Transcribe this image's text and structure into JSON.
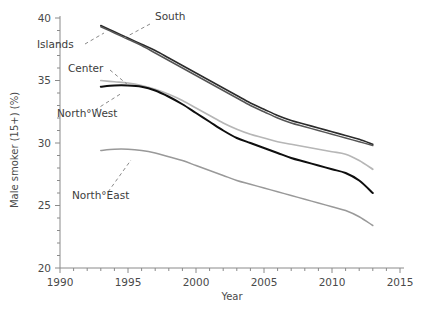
{
  "chart_data": {
    "type": "line",
    "title": "",
    "xlabel": "Year",
    "ylabel": "Male smoker (15+) (%)",
    "xlim": [
      1990,
      2015
    ],
    "ylim": [
      20,
      40
    ],
    "grid": false,
    "legend_position": "inline-annotations",
    "x_ticks": [
      1990,
      1995,
      2000,
      2005,
      2010,
      2015
    ],
    "x_tick_labels": [
      "1990",
      "1995",
      "2000",
      "2005",
      "2010",
      "2015"
    ],
    "x_minor_tick_step": 1,
    "y_ticks": [
      20,
      25,
      30,
      35,
      40
    ],
    "y_tick_labels": [
      "20",
      "25",
      "30",
      "35",
      "40"
    ],
    "y_minor_tick_step": 1,
    "x": [
      1993,
      1994,
      1995,
      1996,
      1997,
      1998,
      1999,
      2000,
      2001,
      2002,
      2003,
      2004,
      2005,
      2006,
      2007,
      2008,
      2009,
      2010,
      2011,
      2012,
      2013
    ],
    "series": [
      {
        "name": "South",
        "color": "#2b2b2b",
        "width": 1.6,
        "values": [
          39.4,
          38.9,
          38.4,
          37.9,
          37.4,
          36.8,
          36.2,
          35.6,
          35.0,
          34.4,
          33.8,
          33.2,
          32.7,
          32.2,
          31.8,
          31.5,
          31.2,
          30.9,
          30.6,
          30.3,
          29.9
        ]
      },
      {
        "name": "Islands",
        "color": "#555555",
        "width": 1.5,
        "values": [
          39.3,
          38.8,
          38.3,
          37.8,
          37.2,
          36.6,
          36.0,
          35.4,
          34.8,
          34.2,
          33.6,
          33.0,
          32.5,
          32.0,
          31.6,
          31.3,
          31.0,
          30.7,
          30.4,
          30.1,
          29.8
        ]
      },
      {
        "name": "Center",
        "color": "#b6b6b6",
        "width": 1.7,
        "values": [
          35.0,
          34.9,
          34.8,
          34.6,
          34.3,
          33.9,
          33.4,
          32.8,
          32.2,
          31.6,
          31.1,
          30.7,
          30.4,
          30.1,
          29.9,
          29.7,
          29.5,
          29.3,
          29.1,
          28.6,
          27.9
        ]
      },
      {
        "name": "North West",
        "color": "#0e0e0e",
        "width": 2.0,
        "values": [
          34.5,
          34.6,
          34.6,
          34.5,
          34.2,
          33.7,
          33.1,
          32.4,
          31.7,
          31.0,
          30.4,
          30.0,
          29.6,
          29.2,
          28.8,
          28.5,
          28.2,
          27.9,
          27.6,
          27.0,
          26.0
        ]
      },
      {
        "name": "North East",
        "color": "#999999",
        "width": 1.5,
        "values": [
          29.4,
          29.5,
          29.5,
          29.4,
          29.2,
          28.9,
          28.6,
          28.2,
          27.8,
          27.4,
          27.0,
          26.7,
          26.4,
          26.1,
          25.8,
          25.5,
          25.2,
          24.9,
          24.6,
          24.1,
          23.4
        ]
      }
    ],
    "annotations": [
      {
        "text": "South",
        "label_x": 155,
        "label_y": 20,
        "anchor": "start",
        "leader": [
          [
            150,
            24
          ],
          [
            124,
            38
          ]
        ]
      },
      {
        "text": "Islands",
        "label_x": 37,
        "label_y": 48,
        "anchor": "start",
        "leader": [
          [
            85,
            44
          ],
          [
            104,
            33
          ]
        ]
      },
      {
        "text": "Center",
        "label_x": 68,
        "label_y": 72,
        "anchor": "start",
        "leader": [
          [
            110,
            70
          ],
          [
            128,
            85
          ]
        ]
      },
      {
        "text": "North°West",
        "label_x": 57,
        "label_y": 117,
        "anchor": "start",
        "leader": [
          [
            95,
            110
          ],
          [
            122,
            93
          ]
        ]
      },
      {
        "text": "North°East",
        "label_x": 72,
        "label_y": 199,
        "anchor": "start",
        "leader": [
          [
            108,
            192
          ],
          [
            131,
            160
          ]
        ]
      }
    ]
  }
}
